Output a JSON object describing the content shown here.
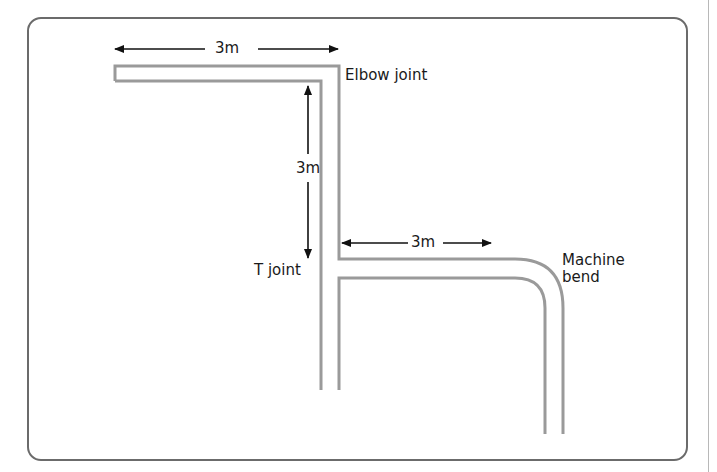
{
  "diagram": {
    "labels": {
      "elbow_joint": "Elbow joint",
      "t_joint": "T joint",
      "machine_bend": "Machine bend"
    },
    "dimensions": {
      "top_horizontal": "3m",
      "vertical": "3m",
      "branch_horizontal": "3m"
    },
    "colors": {
      "pipe": "#9a9a9a",
      "arrow": "#111111",
      "frame": "#6b6b6b",
      "text": "#1a1a1a"
    }
  }
}
